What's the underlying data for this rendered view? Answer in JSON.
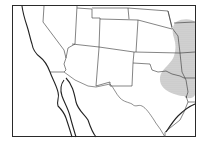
{
  "map": {
    "title": "Range map",
    "region": "Southwestern United States and northern Mexico",
    "colors": {
      "background": "#ffffff",
      "lines": "#2a2a2a",
      "range_fill": "#c8c8c8"
    },
    "layers": [
      "frame",
      "coastline",
      "state-boundaries",
      "international-border",
      "range-shading"
    ],
    "labels": []
  }
}
